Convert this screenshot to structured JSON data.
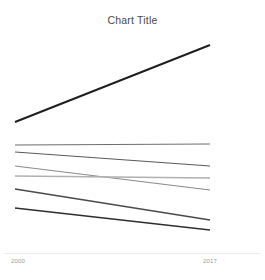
{
  "chart": {
    "title": "Chart Title",
    "clipped_header_text": ""
  },
  "axis": {
    "x_tick_left": "2000",
    "x_tick_right": "2017"
  },
  "chart_data": {
    "type": "line",
    "title": "Chart Title",
    "subtitle": "",
    "xlabel": "",
    "ylabel": "",
    "x": [
      "2000",
      "2017"
    ],
    "xlim": [
      "2000",
      "2017"
    ],
    "grid": false,
    "legend": "none",
    "axis_line_color": "#ededf0",
    "markers": false,
    "series": [
      {
        "name": "Series 1",
        "values": [
          28,
          74
        ],
        "color": "#1f1f1f",
        "width": 1.9
      },
      {
        "name": "Series 2",
        "values": [
          20,
          21
        ],
        "color": "#6e6e6e",
        "width": 1.2
      },
      {
        "name": "Series 3",
        "values": [
          17,
          12
        ],
        "color": "#5a5a5a",
        "width": 1.2
      },
      {
        "name": "Series 4",
        "values": [
          12,
          3
        ],
        "color": "#8a8a8a",
        "width": 1.2
      },
      {
        "name": "Series 5",
        "values": [
          9,
          8
        ],
        "color": "#b0b0b0",
        "width": 1.3
      },
      {
        "name": "Series 6",
        "values": [
          5,
          -7
        ],
        "color": "#4a4a4a",
        "width": 1.3
      },
      {
        "name": "Series 7",
        "values": [
          -2,
          -11
        ],
        "color": "#2e2e2e",
        "width": 1.5
      }
    ],
    "ylim": [
      -20,
      85
    ],
    "_geometry_px": {
      "x_left": 15,
      "x_right": 210,
      "series_endpoints": [
        {
          "name": "Series 1",
          "y_left": 122,
          "y_right": 45
        },
        {
          "name": "Series 2",
          "y_left": 145,
          "y_right": 144
        },
        {
          "name": "Series 3",
          "y_left": 152,
          "y_right": 166
        },
        {
          "name": "Series 4",
          "y_left": 166,
          "y_right": 190
        },
        {
          "name": "Series 5",
          "y_left": 176,
          "y_right": 178
        },
        {
          "name": "Series 6",
          "y_left": 189,
          "y_right": 220
        },
        {
          "name": "Series 7",
          "y_left": 208,
          "y_right": 230
        }
      ],
      "axis_y": 253
    }
  }
}
